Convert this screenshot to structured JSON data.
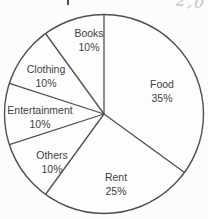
{
  "chart_data": {
    "type": "pie",
    "title": "",
    "start_angle": "top",
    "direction": "clockwise",
    "outline_only": true,
    "stroke_color": "#4f4f4f",
    "fill_color": "#fdfdfd",
    "label_color": "#3d3d3d",
    "slices": [
      {
        "label": "Food",
        "pct_label": "35%",
        "value": 35
      },
      {
        "label": "Rent",
        "pct_label": "25%",
        "value": 25
      },
      {
        "label": "Others",
        "pct_label": "10%",
        "value": 10
      },
      {
        "label": "Entertainment",
        "pct_label": "10%",
        "value": 10
      },
      {
        "label": "Clothing",
        "pct_label": "10%",
        "value": 10
      },
      {
        "label": "Books",
        "pct_label": "10%",
        "value": 10
      }
    ],
    "geometry": {
      "cx": 104,
      "cy": 114,
      "r": 99.5
    }
  },
  "annotations": {
    "handwritten_mark": "2,0"
  }
}
